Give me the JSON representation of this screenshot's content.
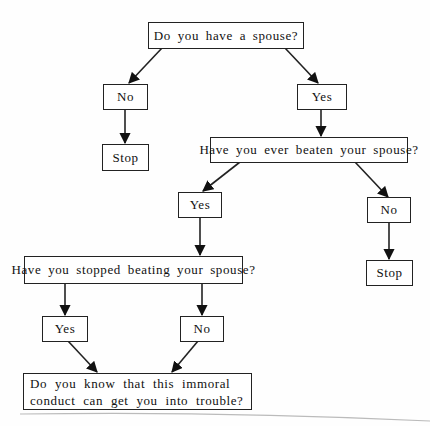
{
  "diagram": {
    "type": "flowchart",
    "nodes": {
      "q_spouse": "Do you have a spouse?",
      "a_no_1": "No",
      "stop_1": "Stop",
      "a_yes_1": "Yes",
      "q_beaten": "Have you ever beaten your spouse?",
      "a_yes_2": "Yes",
      "a_no_2": "No",
      "stop_2": "Stop",
      "q_stopped": "Have you stopped beating your spouse?",
      "a_yes_3": "Yes",
      "a_no_3": "No",
      "q_trouble": "Do you know that this immoral conduct can get you into trouble?"
    },
    "edges": [
      {
        "from": "q_spouse",
        "to": "a_no_1"
      },
      {
        "from": "q_spouse",
        "to": "a_yes_1"
      },
      {
        "from": "a_no_1",
        "to": "stop_1"
      },
      {
        "from": "a_yes_1",
        "to": "q_beaten"
      },
      {
        "from": "q_beaten",
        "to": "a_yes_2"
      },
      {
        "from": "q_beaten",
        "to": "a_no_2"
      },
      {
        "from": "a_no_2",
        "to": "stop_2"
      },
      {
        "from": "a_yes_2",
        "to": "q_stopped"
      },
      {
        "from": "q_stopped",
        "to": "a_yes_3"
      },
      {
        "from": "q_stopped",
        "to": "a_no_3"
      },
      {
        "from": "a_yes_3",
        "to": "q_trouble"
      },
      {
        "from": "a_no_3",
        "to": "q_trouble"
      }
    ],
    "colors": {
      "line": "#222222",
      "box_fill": "#ffffff",
      "background": "#fefefe"
    }
  }
}
